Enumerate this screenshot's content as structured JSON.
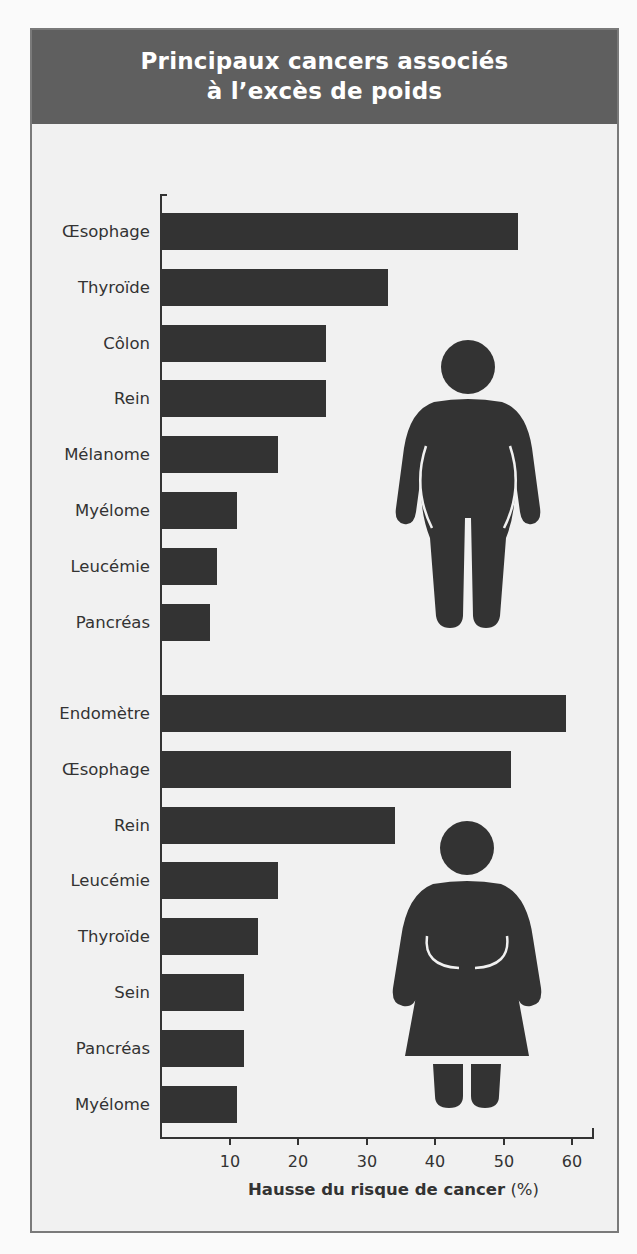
{
  "title": {
    "line1": "Principaux cancers associés",
    "line2": "à l’excès de poids"
  },
  "axis": {
    "x_title": "Hausse du risque de cancer",
    "x_unit": "(%)",
    "ticks": [
      "10",
      "20",
      "30",
      "40",
      "50",
      "60"
    ]
  },
  "colors": {
    "header_bg": "#5f5f5f",
    "bar": "#333333",
    "background": "#f1f1f1"
  },
  "icons": {
    "men": "male-silhouette-icon",
    "women": "female-silhouette-icon"
  },
  "chart_data": {
    "type": "bar",
    "orientation": "horizontal",
    "title": "Principaux cancers associés à l’excès de poids",
    "xlabel": "Hausse du risque de cancer (%)",
    "ylabel": "",
    "xlim": [
      0,
      63
    ],
    "xticks": [
      10,
      20,
      30,
      40,
      50,
      60
    ],
    "grid": false,
    "legend": "none (groups indicated by male and female silhouette icons)",
    "series": [
      {
        "name": "Hommes",
        "categories": [
          "Œsophage",
          "Thyroïde",
          "Côlon",
          "Rein",
          "Mélanome",
          "Myélome",
          "Leucémie",
          "Pancréas"
        ],
        "values": [
          52,
          33,
          24,
          24,
          17,
          11,
          8,
          7
        ]
      },
      {
        "name": "Femmes",
        "categories": [
          "Endomètre",
          "Œsophage",
          "Rein",
          "Leucémie",
          "Thyroïde",
          "Sein",
          "Pancréas",
          "Myélome"
        ],
        "values": [
          59,
          51,
          34,
          17,
          14,
          12,
          12,
          11
        ]
      }
    ]
  }
}
